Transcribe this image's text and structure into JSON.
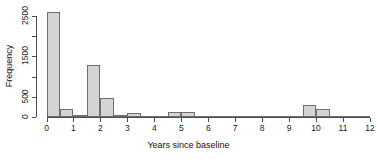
{
  "chart_data": {
    "type": "bar",
    "title": "",
    "xlabel": "Years since baseline",
    "ylabel": "Frequency",
    "xlim": [
      0,
      12
    ],
    "ylim": [
      0,
      2700
    ],
    "bin_width": 0.5,
    "xticks": [
      0,
      1,
      2,
      3,
      4,
      5,
      6,
      7,
      8,
      9,
      10,
      11,
      12
    ],
    "xticklabels": [
      "0",
      "1",
      "2",
      "3",
      "4",
      "5",
      "6",
      "7",
      "8",
      "9",
      "10",
      "11",
      "12"
    ],
    "yticks": [
      0,
      500,
      1500,
      2500
    ],
    "yticklabels": [
      "0",
      "500",
      "1500",
      "2500"
    ],
    "grid": false,
    "legend": false,
    "bar_fill": "#d4d4d4",
    "bar_edge": "#6e6e6e",
    "bins": [
      {
        "x0": 0.0,
        "x1": 0.5,
        "value": 2600
      },
      {
        "x0": 0.5,
        "x1": 1.0,
        "value": 205
      },
      {
        "x0": 1.0,
        "x1": 1.5,
        "value": 60
      },
      {
        "x0": 1.5,
        "x1": 2.0,
        "value": 1300
      },
      {
        "x0": 2.0,
        "x1": 2.5,
        "value": 480
      },
      {
        "x0": 2.5,
        "x1": 3.0,
        "value": 50
      },
      {
        "x0": 3.0,
        "x1": 3.5,
        "value": 95
      },
      {
        "x0": 3.5,
        "x1": 4.0,
        "value": 8
      },
      {
        "x0": 4.0,
        "x1": 4.5,
        "value": 6
      },
      {
        "x0": 4.5,
        "x1": 5.0,
        "value": 115
      },
      {
        "x0": 5.0,
        "x1": 5.5,
        "value": 115
      },
      {
        "x0": 5.5,
        "x1": 6.0,
        "value": 8
      },
      {
        "x0": 6.0,
        "x1": 6.5,
        "value": 6
      },
      {
        "x0": 6.5,
        "x1": 7.0,
        "value": 6
      },
      {
        "x0": 7.0,
        "x1": 7.5,
        "value": 10
      },
      {
        "x0": 7.5,
        "x1": 8.0,
        "value": 3
      },
      {
        "x0": 8.0,
        "x1": 8.5,
        "value": 3
      },
      {
        "x0": 8.5,
        "x1": 9.0,
        "value": 3
      },
      {
        "x0": 9.0,
        "x1": 9.5,
        "value": 18
      },
      {
        "x0": 9.5,
        "x1": 10.0,
        "value": 300
      },
      {
        "x0": 10.0,
        "x1": 10.5,
        "value": 205
      },
      {
        "x0": 10.5,
        "x1": 11.0,
        "value": 22
      },
      {
        "x0": 11.0,
        "x1": 11.5,
        "value": 14
      },
      {
        "x0": 11.5,
        "x1": 12.0,
        "value": 3
      }
    ]
  }
}
